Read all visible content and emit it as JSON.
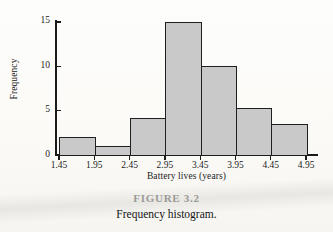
{
  "figure": {
    "number_label": "FIGURE 3.2",
    "caption": "Frequency histogram."
  },
  "chart_data": {
    "type": "bar",
    "title": "",
    "xlabel": "Battery lives (years)",
    "ylabel": "Frequency",
    "categories": [
      "1.45-1.95",
      "1.95-2.45",
      "2.45-2.95",
      "2.95-3.45",
      "3.45-3.95",
      "3.95-4.45",
      "4.45-4.95"
    ],
    "bin_edges": [
      "1.45",
      "1.95",
      "2.45",
      "2.95",
      "3.45",
      "3.95",
      "4.45",
      "4.95"
    ],
    "values": [
      2,
      1,
      4.2,
      15,
      10,
      5.3,
      3.5
    ],
    "xtick_labels": [
      "1.45",
      "1.95",
      "2.45",
      "2.95",
      "3.45",
      "3.95",
      "4.45",
      "4.95"
    ],
    "ytick_labels": [
      "0",
      "5",
      "10",
      "15"
    ],
    "ytick_values": [
      0,
      5,
      10,
      15
    ],
    "ylim": [
      0,
      15.3
    ],
    "xlim": [
      1.45,
      4.95
    ],
    "grid": false,
    "legend": false,
    "bar_fill_color": "#c9c9c9",
    "bar_edge_color": "#1f1f1f",
    "axis_color": "#1b1b1b",
    "background_color": "#fbfaf7"
  }
}
